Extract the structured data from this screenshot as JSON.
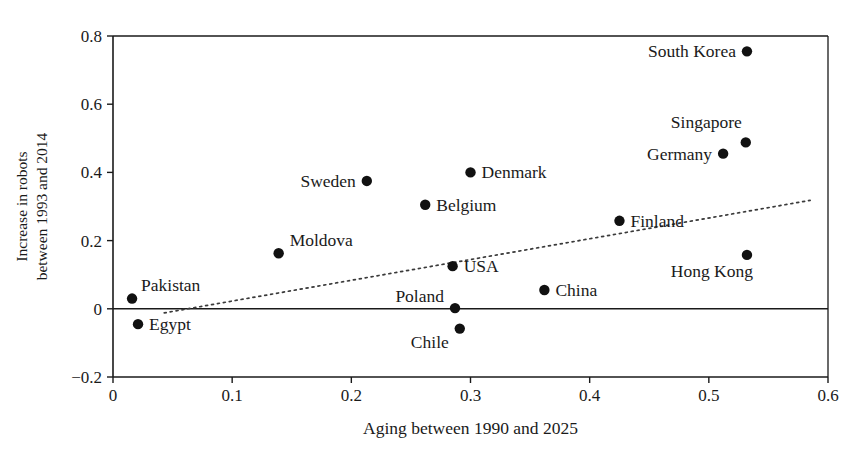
{
  "chart_data": {
    "type": "scatter",
    "title": "",
    "xlabel": "Aging between 1990 and 2025",
    "ylabel": "Increase in robots between 1993 and 2014",
    "ylabel_line1": "Increase in robots",
    "ylabel_line2": "between 1993 and 2014",
    "xlim": [
      0,
      0.6
    ],
    "ylim": [
      -0.2,
      0.8
    ],
    "xticks": [
      0,
      0.1,
      0.2,
      0.3,
      0.4,
      0.5,
      0.6
    ],
    "xtick_labels": [
      "0",
      "0.1",
      "0.2",
      "0.3",
      "0.4",
      "0.5",
      "0.6"
    ],
    "yticks": [
      -0.2,
      0,
      0.2,
      0.4,
      0.6,
      0.8
    ],
    "ytick_labels": [
      "−0.2",
      "0",
      "0.2",
      "0.4",
      "0.6",
      "0.8"
    ],
    "grid": false,
    "legend": "none",
    "marker": "filled-circle",
    "marker_color": "#111111",
    "points": [
      {
        "label": "Pakistan",
        "x": 0.016,
        "y": 0.03,
        "label_pos": "left-above"
      },
      {
        "label": "Egypt",
        "x": 0.021,
        "y": -0.045,
        "label_pos": "right"
      },
      {
        "label": "Moldova",
        "x": 0.139,
        "y": 0.163,
        "label_pos": "right-above"
      },
      {
        "label": "Sweden",
        "x": 0.213,
        "y": 0.375,
        "label_pos": "left"
      },
      {
        "label": "Belgium",
        "x": 0.262,
        "y": 0.305,
        "label_pos": "right"
      },
      {
        "label": "USA",
        "x": 0.285,
        "y": 0.125,
        "label_pos": "right"
      },
      {
        "label": "Poland",
        "x": 0.287,
        "y": 0.002,
        "label_pos": "left-above"
      },
      {
        "label": "Chile",
        "x": 0.291,
        "y": -0.058,
        "label_pos": "left-below"
      },
      {
        "label": "Denmark",
        "x": 0.3,
        "y": 0.4,
        "label_pos": "right"
      },
      {
        "label": "China",
        "x": 0.362,
        "y": 0.055,
        "label_pos": "right"
      },
      {
        "label": "Finland",
        "x": 0.425,
        "y": 0.258,
        "label_pos": "right"
      },
      {
        "label": "Germany",
        "x": 0.512,
        "y": 0.455,
        "label_pos": "left"
      },
      {
        "label": "Singapore",
        "x": 0.531,
        "y": 0.488,
        "label_pos": "left-above"
      },
      {
        "label": "South Korea",
        "x": 0.532,
        "y": 0.755,
        "label_pos": "left"
      },
      {
        "label": "Hong Kong",
        "x": 0.532,
        "y": 0.158,
        "label_pos": "left-below"
      }
    ],
    "trend_line": {
      "style": "dotted",
      "color": "#3a3a3a",
      "x_start": 0.043,
      "y_start": -0.012,
      "x_end": 0.585,
      "y_end": 0.318
    },
    "colors": {
      "marker": "#111111",
      "axis": "#1a1a1a",
      "trend": "#3a3a3a",
      "background": "#ffffff"
    }
  }
}
